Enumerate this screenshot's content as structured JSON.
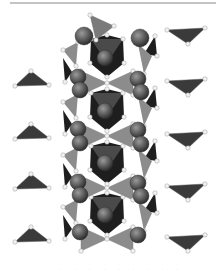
{
  "figure": {
    "title": "",
    "width": 220,
    "height": 273,
    "colors": {
      "background": "#ffffff",
      "rule": "#8a8a8a",
      "triangle_dark": "#3a3a3a",
      "triangle_mid": "#7a7a7a",
      "octa_dark": "#1e1e1e",
      "octa_mid": "#4a4a4a",
      "tetra_light": "#8c8c8c",
      "sphere": "#5a5a5a",
      "sphere_highlight": "#9a9a9a",
      "atom": "#f2f2f2"
    },
    "top_rule": {
      "x1": 10,
      "y1": 3,
      "x2": 216,
      "y2": 3
    },
    "left_triangles": [
      {
        "cx": 30,
        "cy": 77
      },
      {
        "cx": 30,
        "cy": 130
      },
      {
        "cx": 30,
        "cy": 180
      },
      {
        "cx": 30,
        "cy": 233
      }
    ],
    "right_triangles": [
      {
        "cx": 188,
        "cy": 36
      },
      {
        "cx": 188,
        "cy": 87
      },
      {
        "cx": 188,
        "cy": 140
      },
      {
        "cx": 188,
        "cy": 192
      },
      {
        "cx": 188,
        "cy": 243
      }
    ],
    "column": {
      "octahedra_centers": [
        {
          "cx": 107,
          "cy": 55
        },
        {
          "cx": 107,
          "cy": 109
        },
        {
          "cx": 107,
          "cy": 162
        },
        {
          "cx": 107,
          "cy": 213
        }
      ],
      "bowtie_centers": [
        {
          "cx": 107,
          "cy": 83
        },
        {
          "cx": 107,
          "cy": 136
        },
        {
          "cx": 107,
          "cy": 188
        },
        {
          "cx": 107,
          "cy": 239
        }
      ],
      "spheres": [
        {
          "cx": 84,
          "cy": 36,
          "r": 9
        },
        {
          "cx": 140,
          "cy": 38,
          "r": 9
        },
        {
          "cx": 105,
          "cy": 58,
          "r": 8
        },
        {
          "cx": 78,
          "cy": 77,
          "r": 8
        },
        {
          "cx": 80,
          "cy": 90,
          "r": 8
        },
        {
          "cx": 138,
          "cy": 79,
          "r": 8
        },
        {
          "cx": 141,
          "cy": 92,
          "r": 8
        },
        {
          "cx": 105,
          "cy": 111,
          "r": 8
        },
        {
          "cx": 78,
          "cy": 129,
          "r": 8
        },
        {
          "cx": 80,
          "cy": 143,
          "r": 8
        },
        {
          "cx": 138,
          "cy": 130,
          "r": 8
        },
        {
          "cx": 141,
          "cy": 144,
          "r": 8
        },
        {
          "cx": 105,
          "cy": 163,
          "r": 8
        },
        {
          "cx": 78,
          "cy": 182,
          "r": 8
        },
        {
          "cx": 80,
          "cy": 195,
          "r": 8
        },
        {
          "cx": 138,
          "cy": 183,
          "r": 8
        },
        {
          "cx": 141,
          "cy": 196,
          "r": 8
        },
        {
          "cx": 105,
          "cy": 215,
          "r": 8
        },
        {
          "cx": 80,
          "cy": 232,
          "r": 8
        },
        {
          "cx": 138,
          "cy": 235,
          "r": 8
        }
      ],
      "side_tetra_left_x": 70,
      "side_tetra_right_x": 148,
      "side_tetra_rows": [
        52,
        104,
        157,
        209
      ],
      "top_tetra": {
        "x1": 90,
        "y1": 15,
        "x2": 114,
        "y2": 26,
        "x3": 96,
        "y3": 40
      }
    },
    "bottom_marks": ". . . . . . . . ."
  }
}
